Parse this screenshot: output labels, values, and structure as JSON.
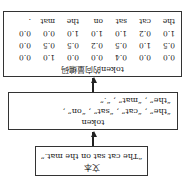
{
  "text_box": {
    "title": "文本",
    "sentence": "“The cat sat on the mat.”"
  },
  "token_box": {
    "title": "token",
    "line1": "“the” , “cat” , “sat” , “on” ,",
    "line2": "“the” , “mat” , “.”"
  },
  "vector_box": {
    "title": "token的向量编码",
    "columns": [
      "the",
      "cat",
      "sat",
      "on",
      "the",
      "mat",
      "."
    ],
    "rows": [
      [
        "0.0",
        "0.0",
        "0.4",
        "0.0",
        "0.0",
        "1.0",
        "0.0"
      ],
      [
        "0.5",
        "1.0",
        "0.5",
        "0.2",
        "0.5",
        "0.5",
        "0.0"
      ],
      [
        "1.0",
        "0.2",
        "1.0",
        "1.0",
        "1.0",
        "0.0",
        "0.0"
      ]
    ]
  },
  "orientation": "rotated 180 degrees"
}
